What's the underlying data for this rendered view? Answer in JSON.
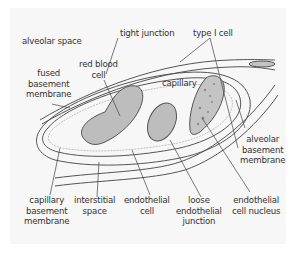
{
  "diagram": {
    "colors": {
      "background": "#f7f7f7",
      "outline": "#555555",
      "red_blood_cell_fill": "#bdbdbd",
      "nucleus_fill": "#c4c4c4",
      "membrane_thin": "#9a9a9a"
    },
    "labels": {
      "alveolar_space": [
        "alveolar space"
      ],
      "tight_junction": [
        "tight junction"
      ],
      "type_i_cell": [
        "type I cell"
      ],
      "red_blood_cell": [
        "red blood",
        "cell"
      ],
      "fused_basement_membrane": [
        "fused",
        "basement",
        "membrane"
      ],
      "capillary": [
        "capillary"
      ],
      "alveolar_basement_membrane": [
        "alveolar",
        "basement",
        "membrane"
      ],
      "capillary_basement_membrane": [
        "capillary",
        "basement",
        "membrane"
      ],
      "interstitial_space": [
        "interstitial",
        "space"
      ],
      "endothelial_cell": [
        "endothelial",
        "cell"
      ],
      "loose_endothelial_junction": [
        "loose",
        "endothelial",
        "junction"
      ],
      "endothelial_cell_nucleus": [
        "endothelial",
        "cell nucleus"
      ]
    }
  }
}
